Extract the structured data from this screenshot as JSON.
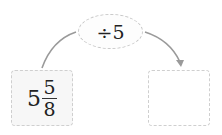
{
  "operation": {
    "symbol": "÷",
    "operand": "5",
    "label": "÷5"
  },
  "input": {
    "whole": "5",
    "numerator": "5",
    "denominator": "8"
  },
  "output": {
    "value": ""
  },
  "colors": {
    "arrow": "#9a9a9a",
    "border": "#cccccc",
    "input_fill": "#f7f7f7"
  }
}
